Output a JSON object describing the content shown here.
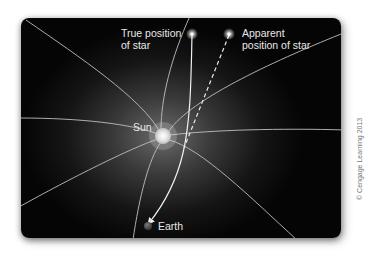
{
  "diagram": {
    "labels": {
      "true_star": "True position\nof star",
      "true_star_line1": "True position",
      "true_star_line2": "of star",
      "apparent_star_line1": "Apparent",
      "apparent_star_line2": "position of star",
      "sun": "Sun",
      "earth": "Earth"
    },
    "credit": "© Cengage Learning 2013",
    "colors": {
      "background": "#050505",
      "field_lines": "#c8c8c8",
      "text": "#e8e8e8",
      "sun": "#f2f2f2",
      "earth": "#555555"
    }
  }
}
